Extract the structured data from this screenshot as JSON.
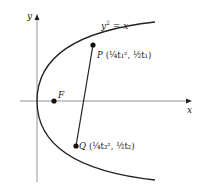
{
  "diagram": {
    "curve_label": "y² = x",
    "curve_label_parts": {
      "base": "y",
      "exp": "2",
      "rest": " = x"
    },
    "axis_x_label": "x",
    "axis_y_label": "y",
    "focus_label": "F",
    "point_P": {
      "name": "P",
      "coords": "(¼t₁², ½t₁)"
    },
    "point_Q": {
      "name": "Q",
      "coords": "(¼t₂², ½t₂)"
    },
    "colors": {
      "stroke": "#222222",
      "axis": "#777777",
      "background": "#ffffff"
    }
  }
}
